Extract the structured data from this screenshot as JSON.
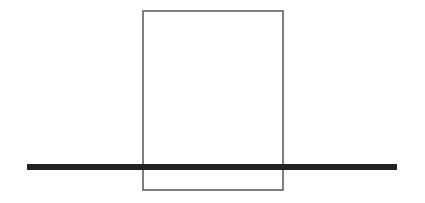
{
  "diagram": {
    "background": "#ffffff",
    "rectangle": {
      "x": 143,
      "y": 11,
      "width": 140,
      "height": 179,
      "stroke": "#555555",
      "stroke_width": 1.5,
      "fill": "none"
    },
    "line": {
      "x1": 27,
      "y1": 167,
      "x2": 397,
      "y2": 167,
      "stroke": "#222222",
      "stroke_width": 6
    }
  }
}
